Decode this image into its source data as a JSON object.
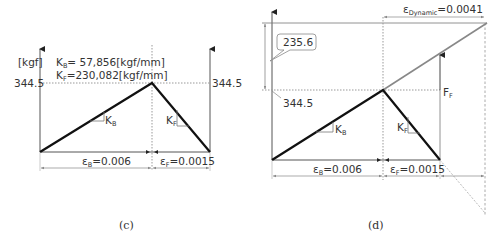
{
  "panel_c": {
    "caption": "(c)",
    "y_unit": "[kgf]",
    "kb_label": "K",
    "kb_sub": "B",
    "kb_value": "= 57,856[kgf/mm]",
    "kf_label": "K",
    "kf_sub": "F",
    "kf_value": "=230,082[kgf/mm]",
    "left_value": "344.5",
    "right_value": "344.5",
    "slope_b_label": "K",
    "slope_b_sub": "B",
    "slope_f_label": "K",
    "slope_f_sub": "F",
    "eps_b_label": "ε",
    "eps_b_sub": "B",
    "eps_b_value": "=0.006",
    "eps_f_label": "ε",
    "eps_f_sub": "F",
    "eps_f_value": "=0.0015"
  },
  "panel_d": {
    "caption": "(d)",
    "callout_value": "235.6",
    "left_value": "344.5",
    "force_label": "F",
    "force_sub": "F",
    "eps_dyn_label": "ε",
    "eps_dyn_sub": "Dynamic",
    "eps_dyn_value": "=0.0041",
    "slope_b_label": "K",
    "slope_b_sub": "B",
    "slope_f_label": "K",
    "slope_f_sub": "F",
    "eps_b_label": "ε",
    "eps_b_sub": "B",
    "eps_b_value": "=0.006",
    "eps_f_label": "ε",
    "eps_f_sub": "F",
    "eps_f_value": "=0.0015"
  },
  "colors": {
    "line_main": "#111111",
    "line_thin": "#666666",
    "line_gray": "#888888",
    "dotted": "#999999"
  }
}
